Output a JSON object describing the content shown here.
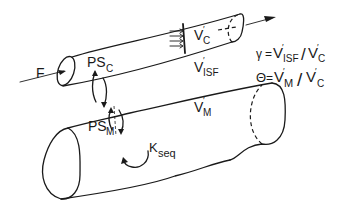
{
  "diagram": {
    "type": "compartment-model",
    "colors": {
      "ink": "#1a1a1a",
      "background": "#ffffff"
    },
    "flow": {
      "label": "F"
    },
    "capillary": {
      "volume_label": "V",
      "volume_sub": "C",
      "exchange_label": "PS",
      "exchange_sub": "C"
    },
    "interstitial": {
      "volume_label": "V",
      "volume_sub": "ISF"
    },
    "muscle": {
      "volume_label": "V",
      "volume_sub": "M",
      "exchange_label": "PS",
      "exchange_sub": "M",
      "sequestration_label": "K",
      "sequestration_sub": "seq"
    },
    "equations": [
      {
        "symbol": "γ",
        "num": "V",
        "num_sub": "ISF",
        "den": "V",
        "den_sub": "C"
      },
      {
        "symbol": "Θ",
        "num": "V",
        "num_sub": "M",
        "den": "V",
        "den_sub": "C"
      }
    ],
    "prime": "′",
    "equals": "=",
    "slash": "/"
  }
}
